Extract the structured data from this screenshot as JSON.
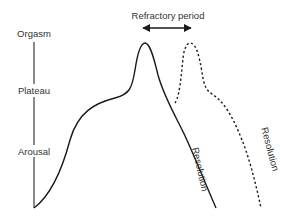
{
  "diagram": {
    "type": "sexual-response-cycle",
    "stage_labels": {
      "orgasm": "Orgasm",
      "plateau": "Plateau",
      "arousal": "Arousal"
    },
    "refractory_label": "Refractory period",
    "resolution_label_1": "Resolution",
    "resolution_label_2": "Resolution",
    "colors": {
      "axis": "#8a8a8a",
      "curve": "#1a1a1a",
      "text": "#333333"
    },
    "curves": [
      {
        "name": "primary-response",
        "style": "solid"
      },
      {
        "name": "second-response",
        "style": "dashed"
      }
    ]
  }
}
